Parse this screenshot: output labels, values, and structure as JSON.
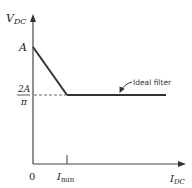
{
  "diagram": {
    "y_axis_label": "V",
    "y_axis_sub": "DC",
    "x_axis_label": "I",
    "x_axis_sub": "DC",
    "point_a_label": "A",
    "level_numerator": "2A",
    "level_denominator": "π",
    "origin_label": "0",
    "imin_label": "I",
    "imin_sub": "min",
    "curve_label": "Ideal filter"
  },
  "colors": {
    "line": "#333333",
    "axis": "#444444",
    "dashed": "#666666"
  }
}
